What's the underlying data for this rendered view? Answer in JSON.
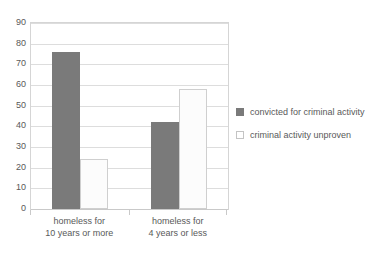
{
  "chart_data": {
    "type": "bar",
    "title": "",
    "xlabel": "",
    "ylabel": "",
    "ylim": [
      0,
      90
    ],
    "ytick_step": 10,
    "yticks": [
      90,
      80,
      70,
      60,
      50,
      40,
      30,
      20,
      10,
      0
    ],
    "grid": true,
    "legend_position": "right",
    "categories": [
      "homeless for 10 years or more",
      "homeless for 4 years or less"
    ],
    "category_lines": [
      [
        "homeless for",
        "10 years or more"
      ],
      [
        "homeless for",
        "4 years or less"
      ]
    ],
    "series": [
      {
        "name": "convicted for criminal activity",
        "values": [
          76,
          42
        ],
        "color": "#7a7a7a"
      },
      {
        "name": "criminal activity unproven",
        "values": [
          24,
          58
        ],
        "color": "#ffffff"
      }
    ]
  },
  "legend": {
    "entries": [
      {
        "label": "convicted for criminal activity",
        "swatch": "filled-dark-square-icon"
      },
      {
        "label": "criminal activity unproven",
        "swatch": "outlined-white-square-icon"
      }
    ]
  }
}
